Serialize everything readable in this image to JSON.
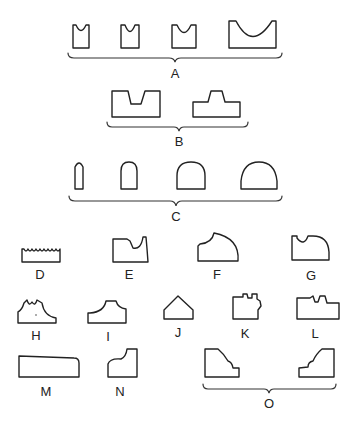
{
  "figure": {
    "groups": [
      {
        "id": "A",
        "label": "A",
        "members": 4,
        "description": "rectangular blocks with concave top cut, increasing width"
      },
      {
        "id": "B",
        "label": "B",
        "members": 2,
        "description": "rectangular notch and stepped tenon profiles"
      },
      {
        "id": "C",
        "label": "C",
        "members": 4,
        "description": "rounded-top (arch) profiles, increasing width"
      },
      {
        "id": "D",
        "label": "D",
        "members": 1,
        "description": "block with serrated/scalloped top"
      },
      {
        "id": "E",
        "label": "E",
        "members": 1,
        "description": "block with curved cutout on right"
      },
      {
        "id": "F",
        "label": "F",
        "members": 1,
        "description": "quarter-round top with cove on left"
      },
      {
        "id": "G",
        "label": "G",
        "members": 1,
        "description": "block with semicircular notch and rounded right corner"
      },
      {
        "id": "H",
        "label": "H",
        "members": 1,
        "description": "double-cove profile with small top notch"
      },
      {
        "id": "I",
        "label": "I",
        "members": 1,
        "description": "symmetric cove-shouldered profile"
      },
      {
        "id": "J",
        "label": "J",
        "members": 1,
        "description": "pointed gable profile"
      },
      {
        "id": "K",
        "label": "K",
        "members": 1,
        "description": "block with top notch and right side step"
      },
      {
        "id": "L",
        "label": "L",
        "members": 1,
        "description": "wide block with top notch and right step"
      },
      {
        "id": "M",
        "label": "M",
        "members": 1,
        "description": "long flat profile with rounded right corner"
      },
      {
        "id": "N",
        "label": "N",
        "members": 1,
        "description": "ogee-topped block"
      },
      {
        "id": "O",
        "label": "O",
        "members": 2,
        "description": "mirrored ogee / stepped profiles"
      }
    ]
  },
  "labels": {
    "A": "A",
    "B": "B",
    "C": "C",
    "D": "D",
    "E": "E",
    "F": "F",
    "G": "G",
    "H": "H",
    "I": "I",
    "J": "J",
    "K": "K",
    "L": "L",
    "M": "M",
    "N": "N",
    "O": "O"
  },
  "colors": {
    "stroke": "#222222",
    "background": "#ffffff"
  }
}
